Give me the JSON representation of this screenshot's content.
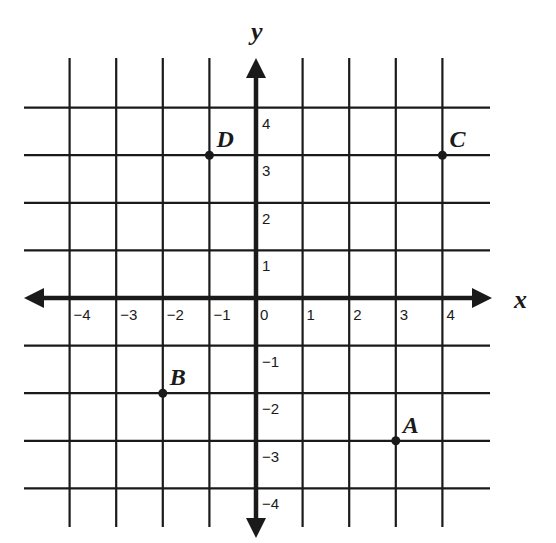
{
  "chart_data": {
    "type": "scatter",
    "title": "",
    "xlabel": "x",
    "ylabel": "y",
    "xlim": [
      -4,
      4
    ],
    "ylim": [
      -4,
      4
    ],
    "grid": true,
    "x_ticks": [
      "−4",
      "−3",
      "−2",
      "−1",
      "0",
      "1",
      "2",
      "3",
      "4"
    ],
    "y_ticks": [
      "4",
      "3",
      "2",
      "1",
      "−1",
      "−2",
      "−3",
      "−4"
    ],
    "points": [
      {
        "label": "A",
        "x": 3,
        "y": -3
      },
      {
        "label": "B",
        "x": -2,
        "y": -2
      },
      {
        "label": "C",
        "x": 4,
        "y": 3
      },
      {
        "label": "D",
        "x": -1,
        "y": 3
      }
    ]
  },
  "colors": {
    "ink": "#1a1a1a",
    "background": "#ffffff"
  }
}
